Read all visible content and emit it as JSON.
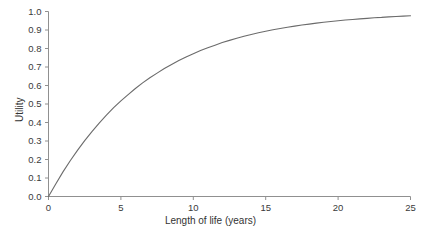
{
  "chart_data": {
    "type": "line",
    "title": "",
    "subtitle": "",
    "xlabel": "Length of life (years)",
    "ylabel": "Utility",
    "xlim": [
      0,
      25
    ],
    "ylim": [
      0,
      1.0
    ],
    "xticks": [
      0,
      5,
      10,
      15,
      20,
      25
    ],
    "xtick_labels": [
      "0",
      "5",
      "10",
      "15",
      "20",
      "25"
    ],
    "yticks": [
      0.0,
      0.1,
      0.2,
      0.3,
      0.4,
      0.5,
      0.6,
      0.7,
      0.8,
      0.9,
      1.0
    ],
    "ytick_labels": [
      "0.0",
      "0.1",
      "0.2",
      "0.3",
      "0.4",
      "0.5",
      "0.6",
      "0.7",
      "0.8",
      "0.9",
      "1.0"
    ],
    "grid": false,
    "legend": null,
    "legend_position": "none",
    "annotations": [],
    "series": [
      {
        "name": "Utility curve",
        "color": "#6b6b6b",
        "line_width": 1.1,
        "x": [
          0,
          0.5,
          1,
          1.5,
          2,
          2.5,
          3,
          3.5,
          4,
          4.5,
          5,
          5.5,
          6,
          6.5,
          7,
          7.5,
          8,
          8.5,
          9,
          9.5,
          10,
          10.5,
          11,
          11.5,
          12,
          12.5,
          13,
          13.5,
          14,
          14.5,
          15,
          15.5,
          16,
          16.5,
          17,
          17.5,
          18,
          18.5,
          19,
          19.5,
          20,
          20.5,
          21,
          21.5,
          22,
          22.5,
          23,
          23.5,
          24,
          24.5,
          25
        ],
        "values": [
          0.0,
          0.068,
          0.133,
          0.193,
          0.249,
          0.302,
          0.351,
          0.397,
          0.44,
          0.48,
          0.517,
          0.551,
          0.584,
          0.614,
          0.642,
          0.667,
          0.692,
          0.714,
          0.735,
          0.754,
          0.772,
          0.789,
          0.804,
          0.818,
          0.832,
          0.844,
          0.855,
          0.866,
          0.876,
          0.885,
          0.893,
          0.901,
          0.908,
          0.915,
          0.921,
          0.927,
          0.932,
          0.937,
          0.942,
          0.946,
          0.95,
          0.954,
          0.957,
          0.96,
          0.963,
          0.966,
          0.968,
          0.971,
          0.973,
          0.975,
          0.977
        ]
      }
    ],
    "key_points": [
      {
        "x": 0,
        "y": 0.0
      },
      {
        "x": 5,
        "y": 0.52
      },
      {
        "x": 10,
        "y": 0.75
      },
      {
        "x": 15,
        "y": 0.87
      },
      {
        "x": 20,
        "y": 0.95
      },
      {
        "x": 25,
        "y": 0.98
      }
    ],
    "function_note": "U = 1 - exp(-t/6.75)"
  },
  "axes": {
    "axis_color": "#909090",
    "tick_color": "#909090",
    "text_color": "#333333"
  }
}
